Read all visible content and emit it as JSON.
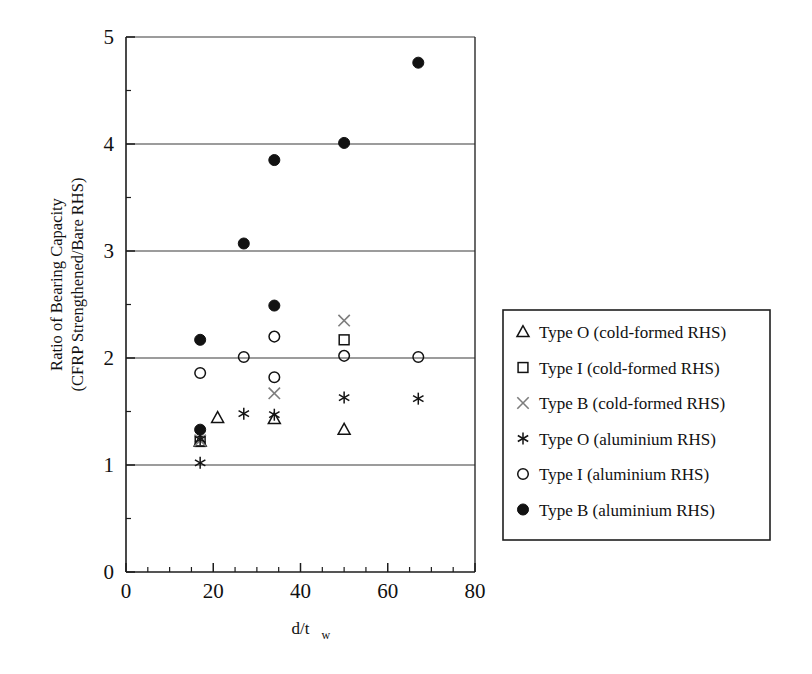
{
  "chart_data": {
    "type": "scatter",
    "title": "",
    "xlabel": "d/t_w",
    "xlabel_main": "d/t",
    "xlabel_sub": "w",
    "ylabel": "Ratio of Bearing Capacity (CFRP Strengthened/Bare RHS)",
    "ylabel_line1": "Ratio of Bearing Capacity",
    "ylabel_line2": "(CFRP Strengthened/Bare RHS)",
    "xlim": [
      0,
      80
    ],
    "ylim": [
      0,
      5
    ],
    "xticks": [
      0,
      20,
      40,
      60,
      80
    ],
    "xticklabels": [
      "0",
      "20",
      "40",
      "60",
      "80"
    ],
    "xminor_step": 5,
    "yticks": [
      0,
      1,
      2,
      3,
      4,
      5
    ],
    "yticklabels": [
      "0",
      "1",
      "2",
      "3",
      "4",
      "5"
    ],
    "yminor_step": 0.5,
    "grid": "horizontal-major",
    "legend_position": "right-outside",
    "series": [
      {
        "name": "Type O (cold-formed RHS)",
        "marker": "triangle-open",
        "color": "#121212",
        "points": [
          {
            "x": 17,
            "y": 1.22
          },
          {
            "x": 21,
            "y": 1.44
          },
          {
            "x": 34,
            "y": 1.43
          },
          {
            "x": 50,
            "y": 1.33
          }
        ]
      },
      {
        "name": "Type I (cold-formed RHS)",
        "marker": "square-open",
        "color": "#121212",
        "points": [
          {
            "x": 17,
            "y": 1.22
          },
          {
            "x": 50,
            "y": 2.17
          }
        ]
      },
      {
        "name": "Type B (cold-formed RHS)",
        "marker": "cross-x",
        "color": "#7d7d7d",
        "points": [
          {
            "x": 17,
            "y": 1.23
          },
          {
            "x": 34,
            "y": 1.67
          },
          {
            "x": 50,
            "y": 2.35
          }
        ]
      },
      {
        "name": "Type O (aluminium RHS)",
        "marker": "asterisk",
        "color": "#121212",
        "points": [
          {
            "x": 17,
            "y": 1.02
          },
          {
            "x": 17,
            "y": 1.24
          },
          {
            "x": 27,
            "y": 1.48
          },
          {
            "x": 34,
            "y": 1.47
          },
          {
            "x": 50,
            "y": 1.63
          },
          {
            "x": 67,
            "y": 1.62
          }
        ]
      },
      {
        "name": "Type I (aluminium RHS)",
        "marker": "circle-open",
        "color": "#121212",
        "points": [
          {
            "x": 17,
            "y": 1.86
          },
          {
            "x": 27,
            "y": 2.01
          },
          {
            "x": 34,
            "y": 2.2
          },
          {
            "x": 34,
            "y": 1.82
          },
          {
            "x": 50,
            "y": 2.02
          },
          {
            "x": 67,
            "y": 2.01
          }
        ]
      },
      {
        "name": "Type B (aluminium RHS)",
        "marker": "circle-filled",
        "color": "#121212",
        "points": [
          {
            "x": 17,
            "y": 1.33
          },
          {
            "x": 17,
            "y": 2.17
          },
          {
            "x": 27,
            "y": 3.07
          },
          {
            "x": 34,
            "y": 2.49
          },
          {
            "x": 34,
            "y": 3.85
          },
          {
            "x": 50,
            "y": 4.01
          },
          {
            "x": 67,
            "y": 4.76
          }
        ]
      }
    ]
  },
  "legend": {
    "items": [
      {
        "marker": "triangle-open",
        "label": "Type O (cold-formed RHS)"
      },
      {
        "marker": "square-open",
        "label": "Type I (cold-formed RHS)"
      },
      {
        "marker": "cross-x",
        "label": "Type B (cold-formed RHS)"
      },
      {
        "marker": "asterisk",
        "label": "Type O (aluminium RHS)"
      },
      {
        "marker": "circle-open",
        "label": "Type I (aluminium RHS)"
      },
      {
        "marker": "circle-filled",
        "label": "Type B (aluminium RHS)"
      }
    ]
  },
  "colors": {
    "axis": "#1c1c1c",
    "grid": "#3a3a3a",
    "marker_dark": "#121212",
    "marker_grey": "#7d7d7d",
    "background": "#ffffff"
  }
}
